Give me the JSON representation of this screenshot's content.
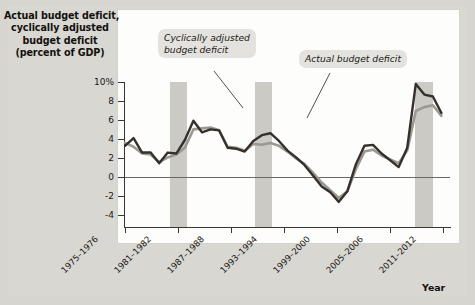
{
  "figure": {
    "title_lines": [
      "Actual budget deficit,",
      "cyclically adjusted",
      "budget deficit",
      "(percent of GDP)"
    ],
    "axis_title_x": "Year",
    "callouts": [
      {
        "id": "cyclically-adjusted",
        "line1": "Cyclically adjusted",
        "line2": "budget deficit"
      },
      {
        "id": "actual",
        "line1": "Actual budget deficit",
        "line2": ""
      }
    ]
  },
  "chart_data": {
    "type": "line",
    "title": "Actual budget deficit, cyclically adjusted budget deficit (percent of GDP)",
    "xlabel": "Year",
    "ylabel": "percent of GDP",
    "ylim": [
      -5,
      10
    ],
    "yticks": [
      10,
      8,
      6,
      4,
      2,
      0,
      -2,
      -4
    ],
    "ytick_labels": [
      "10%",
      "8",
      "6",
      "4",
      "2",
      "0",
      "-2",
      "-4"
    ],
    "grid": false,
    "legend": "annotations",
    "x_tick_labels": [
      "1975–1976",
      "1981–1982",
      "1987–1988",
      "1993–1994",
      "1999–2000",
      "2005–2006",
      "2011–2012"
    ],
    "x_tick_years": [
      1975,
      1981,
      1987,
      1993,
      1999,
      2005,
      2011
    ],
    "xlim": [
      1975,
      2013
    ],
    "shaded_regions": [
      {
        "label": "recession",
        "start": 1981.0,
        "end": 1982.4
      },
      {
        "label": "recession",
        "start": 1990.2,
        "end": 1991.6
      },
      {
        "label": "recession",
        "start": 2007.8,
        "end": 2009.4
      }
    ],
    "x": [
      1975,
      1976,
      1977,
      1978,
      1979,
      1980,
      1981,
      1982,
      1983,
      1984,
      1985,
      1986,
      1987,
      1988,
      1989,
      1990,
      1991,
      1992,
      1993,
      1994,
      1995,
      1996,
      1997,
      1998,
      1999,
      2000,
      2001,
      2002,
      2003,
      2004,
      2005,
      2006,
      2007,
      2008,
      2009,
      2010,
      2011,
      2012
    ],
    "series": [
      {
        "name": "Actual budget deficit",
        "color": "#35302c",
        "values": [
          3.4,
          4.2,
          2.7,
          2.7,
          1.6,
          2.7,
          2.6,
          4.0,
          6.0,
          4.8,
          5.1,
          5.0,
          3.2,
          3.1,
          2.8,
          3.9,
          4.5,
          4.7,
          3.9,
          2.9,
          2.2,
          1.4,
          0.3,
          -0.8,
          -1.4,
          -2.4,
          -1.3,
          1.5,
          3.4,
          3.5,
          2.6,
          1.9,
          1.2,
          3.2,
          9.8,
          8.7,
          8.5,
          6.8
        ]
      },
      {
        "name": "Cyclically adjusted budget deficit",
        "color": "#9b9992",
        "values": [
          3.7,
          3.3,
          2.6,
          2.5,
          1.7,
          2.2,
          2.5,
          3.2,
          5.1,
          5.2,
          5.3,
          5.0,
          3.3,
          3.2,
          2.9,
          3.6,
          3.5,
          3.7,
          3.4,
          2.8,
          2.1,
          1.5,
          0.6,
          -0.4,
          -1.2,
          -2.0,
          -1.3,
          1.0,
          2.8,
          3.0,
          2.4,
          2.0,
          1.6,
          2.9,
          7.0,
          7.4,
          7.6,
          6.5
        ]
      }
    ]
  },
  "axis": {
    "ylabels": [
      "10%",
      "8",
      "6",
      "4",
      "2",
      "0",
      "-2",
      "-4"
    ],
    "xlabels": [
      "1975–1976",
      "1981–1982",
      "1987–1988",
      "1993–1994",
      "1999–2000",
      "2005–2006",
      "2011–2012"
    ]
  }
}
